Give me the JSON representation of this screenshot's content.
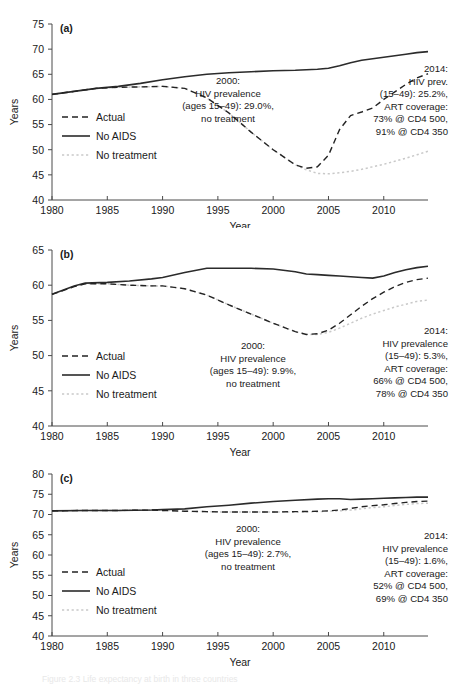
{
  "figure": {
    "caption": "Figure 2.3  Life expectancy at birth in three countries",
    "axis_titles": {
      "x": "Year",
      "y": "Years"
    },
    "legend": {
      "actual": "Actual",
      "no_aids": "No AIDS",
      "no_treatment": "No treatment"
    }
  },
  "chart_data": [
    {
      "type": "line",
      "panel": "(a)",
      "title": "",
      "xlabel": "Year",
      "ylabel": "Years",
      "xlim": [
        1980,
        2014
      ],
      "ylim": [
        40,
        75
      ],
      "yticks": [
        40,
        45,
        50,
        55,
        60,
        65,
        70,
        75
      ],
      "xticks": [
        1980,
        1985,
        1990,
        1995,
        2000,
        2005,
        2010
      ],
      "grid": false,
      "legend_position": "center-left",
      "x": [
        1980,
        1982,
        1984,
        1986,
        1988,
        1990,
        1992,
        1994,
        1996,
        1998,
        2000,
        2002,
        2003,
        2004,
        2005,
        2006,
        2007,
        2008,
        2009,
        2010,
        2011,
        2012,
        2013,
        2014
      ],
      "series": [
        {
          "name": "Actual",
          "style": "dashed",
          "values": [
            61.0,
            61.6,
            62.2,
            62.4,
            62.5,
            62.6,
            62.2,
            60.3,
            57.3,
            53.5,
            50.0,
            47.0,
            46.3,
            46.6,
            48.9,
            54.0,
            56.8,
            57.5,
            58.3,
            60.0,
            61.5,
            63.0,
            64.3,
            65.1
          ]
        },
        {
          "name": "No AIDS",
          "style": "solid",
          "values": [
            61.0,
            61.6,
            62.2,
            62.6,
            63.2,
            63.9,
            64.5,
            65.0,
            65.3,
            65.5,
            65.7,
            65.8,
            65.9,
            66.0,
            66.2,
            66.7,
            67.3,
            67.8,
            68.1,
            68.4,
            68.7,
            69.0,
            69.3,
            69.5
          ]
        },
        {
          "name": "No treatment",
          "style": "dotted-light",
          "values": [
            61.0,
            61.6,
            62.2,
            62.4,
            62.5,
            62.6,
            62.2,
            60.3,
            57.3,
            53.5,
            50.0,
            47.0,
            46.0,
            45.3,
            45.2,
            45.4,
            45.7,
            46.1,
            46.6,
            47.1,
            47.7,
            48.3,
            49.0,
            49.7
          ]
        }
      ],
      "annotations": [
        {
          "name": "annotation-2000",
          "lines": [
            "2000:",
            "HIV prevalence",
            "(ages 15–49): 29.0%,",
            "no treatment"
          ],
          "anchor_x": 2000,
          "anchor_y": 58.0
        },
        {
          "name": "annotation-2014",
          "lines": [
            "2014:",
            "HIV prev.",
            "(15–49): 25.2%,",
            "ART coverage:",
            "73% @ CD4 500,",
            "91% @ CD4 350"
          ],
          "anchor_x": 2012,
          "anchor_y": 59.0
        }
      ]
    },
    {
      "type": "line",
      "panel": "(b)",
      "title": "",
      "xlabel": "Year",
      "ylabel": "Years",
      "xlim": [
        1980,
        2014
      ],
      "ylim": [
        40,
        65
      ],
      "yticks": [
        40,
        45,
        50,
        55,
        60,
        65
      ],
      "xticks": [
        1980,
        1985,
        1990,
        1995,
        2000,
        2005,
        2010
      ],
      "grid": false,
      "legend_position": "lower-left",
      "x": [
        1980,
        1982,
        1983,
        1985,
        1987,
        1989,
        1990,
        1992,
        1994,
        1996,
        1998,
        2000,
        2002,
        2003,
        2004,
        2005,
        2006,
        2007,
        2008,
        2009,
        2010,
        2011,
        2012,
        2013,
        2014
      ],
      "series": [
        {
          "name": "Actual",
          "style": "dashed",
          "values": [
            58.7,
            59.8,
            60.2,
            60.2,
            60.0,
            59.9,
            59.9,
            59.5,
            58.6,
            57.2,
            55.9,
            54.6,
            53.4,
            53.0,
            53.1,
            53.6,
            54.6,
            55.8,
            57.0,
            58.1,
            59.0,
            59.8,
            60.4,
            60.8,
            61.0
          ]
        },
        {
          "name": "No AIDS",
          "style": "solid",
          "values": [
            58.7,
            59.9,
            60.3,
            60.4,
            60.6,
            60.9,
            61.1,
            61.8,
            62.4,
            62.4,
            62.4,
            62.3,
            61.9,
            61.6,
            61.5,
            61.4,
            61.3,
            61.2,
            61.1,
            61.0,
            61.3,
            61.8,
            62.2,
            62.5,
            62.7
          ]
        },
        {
          "name": "No treatment",
          "style": "dotted-light",
          "values": [
            58.7,
            59.8,
            60.2,
            60.2,
            60.0,
            59.9,
            59.9,
            59.5,
            58.6,
            57.2,
            55.9,
            54.6,
            53.4,
            53.0,
            53.0,
            53.3,
            53.9,
            54.6,
            55.3,
            55.9,
            56.4,
            56.9,
            57.3,
            57.7,
            57.9
          ]
        }
      ],
      "annotations": [
        {
          "name": "annotation-2000",
          "lines": [
            "2000:",
            "HIV prevalence",
            "(ages 15–49): 9.9%,",
            "no treatment"
          ],
          "anchor_x": 2000,
          "anchor_y": 49.0
        },
        {
          "name": "annotation-2014",
          "lines": [
            "2014:",
            "HIV prevalence",
            "(15–49): 5.3%,",
            "ART coverage:",
            "66% @ CD4 500,",
            "78% @ CD4 350"
          ],
          "anchor_x": 2012,
          "anchor_y": 50.5
        }
      ]
    },
    {
      "type": "line",
      "panel": "(c)",
      "title": "",
      "xlabel": "Year",
      "ylabel": "Years",
      "xlim": [
        1980,
        2014
      ],
      "ylim": [
        40,
        80
      ],
      "yticks": [
        40,
        45,
        50,
        55,
        60,
        65,
        70,
        75,
        80
      ],
      "xticks": [
        1980,
        1985,
        1990,
        1995,
        2000,
        2005,
        2010
      ],
      "grid": false,
      "legend_position": "lower-left",
      "x": [
        1980,
        1983,
        1986,
        1989,
        1990,
        1992,
        1994,
        1996,
        1998,
        2000,
        2002,
        2004,
        2005,
        2006,
        2007,
        2008,
        2009,
        2010,
        2011,
        2012,
        2013,
        2014
      ],
      "series": [
        {
          "name": "Actual",
          "style": "dashed",
          "values": [
            70.9,
            71.0,
            71.0,
            71.1,
            71.0,
            70.8,
            70.7,
            70.6,
            70.6,
            70.6,
            70.7,
            70.8,
            70.9,
            71.1,
            71.5,
            71.9,
            72.2,
            72.4,
            72.7,
            73.0,
            73.2,
            73.3
          ]
        },
        {
          "name": "No AIDS",
          "style": "solid",
          "values": [
            70.9,
            71.0,
            71.0,
            71.1,
            71.2,
            71.4,
            71.9,
            72.3,
            72.8,
            73.2,
            73.5,
            73.8,
            73.9,
            73.9,
            73.7,
            73.8,
            73.9,
            74.0,
            74.1,
            74.2,
            74.3,
            74.3
          ]
        },
        {
          "name": "No treatment",
          "style": "dotted-light",
          "values": [
            70.9,
            71.0,
            71.0,
            71.1,
            71.0,
            70.8,
            70.7,
            70.6,
            70.6,
            70.6,
            70.6,
            70.7,
            70.8,
            70.9,
            71.1,
            71.4,
            71.7,
            71.9,
            72.2,
            72.5,
            72.7,
            72.8
          ]
        }
      ],
      "annotations": [
        {
          "name": "annotation-2000",
          "lines": [
            "2000:",
            "HIV prevalence",
            "(ages 15–49): 2.7%,",
            "no treatment"
          ],
          "anchor_x": 2000,
          "anchor_y": 62.0
        },
        {
          "name": "annotation-2014",
          "lines": [
            "2014:",
            "HIV prevalence",
            "(15–49): 1.6%,",
            "ART coverage:",
            "52% @ CD4 500,",
            "69% @ CD4 350"
          ],
          "anchor_x": 2012,
          "anchor_y": 61.0
        }
      ]
    }
  ]
}
